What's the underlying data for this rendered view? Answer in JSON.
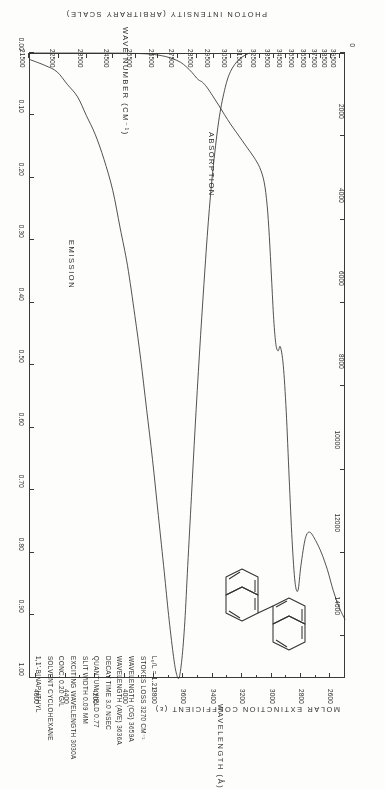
{
  "figure": {
    "compound": "1,1'-BINAPHTHYL",
    "molecule_name": "binaphthyl-structure"
  },
  "axes": {
    "wavelength": {
      "title": "WAVELENGTH  (Å)",
      "ticks": [
        "2600",
        "2800",
        "3000",
        "3200",
        "3400",
        "3600",
        "3800",
        "4000",
        "4200",
        "4400",
        "4600"
      ],
      "min": 2500,
      "max": 4650
    },
    "wavenumber": {
      "title": "WAVE NUMBER  (CM⁻¹)",
      "ticks": [
        "40500",
        "39500",
        "38500",
        "37500",
        "36500",
        "35500",
        "34500",
        "33500",
        "32500",
        "31500",
        "30500",
        "29500",
        "28500",
        "27500",
        "26500",
        "25500",
        "24500",
        "23500",
        "22500",
        "21500"
      ],
      "min": 21500,
      "max": 40500
    },
    "epsilon": {
      "title": "MOLAR EXTINCTION COEFFICIENT  (ε)",
      "ticks": [
        "14000",
        "12000",
        "10000",
        "8000",
        "6000",
        "4000",
        "2000",
        "0"
      ],
      "min": 0,
      "max": 15000
    },
    "intensity": {
      "title": "PHOTON INTENSITY (ARBITRARY SCALE)",
      "ticks": [
        "1.00",
        "0.90",
        "0.80",
        "0.70",
        "0.60",
        "0.50",
        "0.40",
        "0.30",
        "0.20",
        "0.10",
        "0.00"
      ],
      "min": 0,
      "max": 1.0
    }
  },
  "series_labels": {
    "absorption": "ABSORPTION",
    "emission": "EMISSION"
  },
  "annotations": [
    "1,1'-BINAPHTHYL",
    "SOLVENT  CYCLOHEXANE",
    "CONC.  0.20 G/L",
    "EXCITING WAVELENGTH  3030A",
    "SLIT WIDTH  0.09 MM",
    "QUANTUM YIELD  0.77",
    "DECAY TIME  3.0 NSEC",
    "WAVELENGTH (AVE)  3636A",
    "WAVELENGTH (CG)  3659A",
    "STOKES LOSS  3270 CM⁻¹",
    "L₀/L = 1.21"
  ],
  "chart_data": {
    "type": "line",
    "xlabel": "WAVELENGTH  (Å)",
    "xlabel2": "WAVE NUMBER  (CM⁻¹)",
    "ylabel": "MOLAR EXTINCTION COEFFICIENT  (ε)",
    "ylabel2": "PHOTON INTENSITY (ARBITRARY SCALE)",
    "xlim": [
      2500,
      4650
    ],
    "grid": false,
    "legend": "inline-annotations",
    "series": [
      {
        "name": "ABSORPTION",
        "axis": "epsilon",
        "ylim": [
          0,
          15000
        ],
        "points": [
          [
            2500,
            13600
          ],
          [
            2540,
            13300
          ],
          [
            2580,
            12900
          ],
          [
            2620,
            12400
          ],
          [
            2660,
            12000
          ],
          [
            2700,
            11700
          ],
          [
            2740,
            11500
          ],
          [
            2770,
            11650
          ],
          [
            2800,
            12300
          ],
          [
            2820,
            12900
          ],
          [
            2840,
            12700
          ],
          [
            2860,
            11700
          ],
          [
            2880,
            10200
          ],
          [
            2900,
            8600
          ],
          [
            2920,
            7500
          ],
          [
            2940,
            7050
          ],
          [
            2955,
            7150
          ],
          [
            2970,
            7000
          ],
          [
            2985,
            6400
          ],
          [
            3000,
            5400
          ],
          [
            3015,
            4400
          ],
          [
            3030,
            3650
          ],
          [
            3050,
            3100
          ],
          [
            3080,
            2750
          ],
          [
            3120,
            2500
          ],
          [
            3160,
            2300
          ],
          [
            3200,
            2100
          ],
          [
            3240,
            1900
          ],
          [
            3280,
            1700
          ],
          [
            3320,
            1480
          ],
          [
            3360,
            1250
          ],
          [
            3400,
            1030
          ],
          [
            3440,
            820
          ],
          [
            3470,
            700
          ],
          [
            3490,
            660
          ],
          [
            3510,
            600
          ],
          [
            3540,
            470
          ],
          [
            3580,
            330
          ],
          [
            3620,
            220
          ],
          [
            3670,
            140
          ],
          [
            3720,
            85
          ],
          [
            3780,
            45
          ],
          [
            3850,
            20
          ],
          [
            3950,
            8
          ],
          [
            4100,
            2
          ],
          [
            4650,
            0
          ]
        ]
      },
      {
        "name": "EMISSION",
        "axis": "intensity",
        "ylim": [
          0,
          1.0
        ],
        "points": [
          [
            3150,
            0.0
          ],
          [
            3220,
            0.01
          ],
          [
            3280,
            0.03
          ],
          [
            3320,
            0.06
          ],
          [
            3360,
            0.11
          ],
          [
            3400,
            0.19
          ],
          [
            3430,
            0.27
          ],
          [
            3460,
            0.37
          ],
          [
            3490,
            0.48
          ],
          [
            3520,
            0.6
          ],
          [
            3545,
            0.71
          ],
          [
            3570,
            0.82
          ],
          [
            3590,
            0.91
          ],
          [
            3610,
            0.97
          ],
          [
            3630,
            1.0
          ],
          [
            3650,
            0.99
          ],
          [
            3670,
            0.96
          ],
          [
            3700,
            0.9
          ],
          [
            3730,
            0.83
          ],
          [
            3770,
            0.74
          ],
          [
            3810,
            0.65
          ],
          [
            3850,
            0.57
          ],
          [
            3890,
            0.49
          ],
          [
            3930,
            0.42
          ],
          [
            3980,
            0.34
          ],
          [
            4030,
            0.28
          ],
          [
            4080,
            0.22
          ],
          [
            4140,
            0.17
          ],
          [
            4200,
            0.13
          ],
          [
            4260,
            0.1
          ],
          [
            4320,
            0.07
          ],
          [
            4390,
            0.05
          ],
          [
            4460,
            0.03
          ],
          [
            4540,
            0.02
          ],
          [
            4650,
            0.01
          ]
        ]
      }
    ]
  }
}
